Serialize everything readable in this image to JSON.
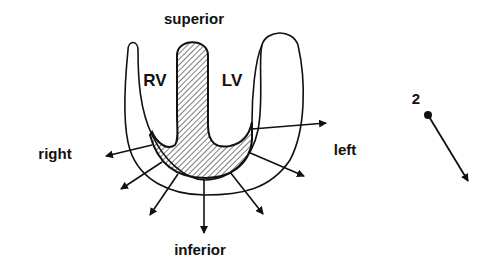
{
  "labels": {
    "superior": "superior",
    "inferior": "inferior",
    "right": "right",
    "left": "left",
    "rv": "RV",
    "lv": "LV",
    "lead_number": "2"
  },
  "colors": {
    "ink": "#111111",
    "background": "#ffffff"
  },
  "structures": [
    {
      "name": "right-ventricle",
      "label": "RV"
    },
    {
      "name": "left-ventricle",
      "label": "LV"
    },
    {
      "name": "interventricular-septum-and-apex",
      "style": "hatched"
    }
  ],
  "vector_arrows": [
    {
      "direction": "left"
    },
    {
      "direction": "left-inferior"
    },
    {
      "direction": "inferior-left"
    },
    {
      "direction": "inferior"
    },
    {
      "direction": "inferior-right"
    },
    {
      "direction": "right-inferior"
    },
    {
      "direction": "right"
    }
  ]
}
